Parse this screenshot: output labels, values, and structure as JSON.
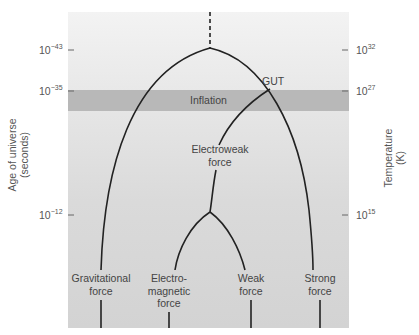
{
  "left_axis": {
    "title_line1": "Age of universe",
    "title_line2": "(seconds)",
    "ticks": [
      {
        "base": "10",
        "exp": "−43"
      },
      {
        "base": "10",
        "exp": "−35"
      },
      {
        "base": "10",
        "exp": "−12"
      }
    ]
  },
  "right_axis": {
    "title_line1": "Temperature",
    "title_line2": "(K)",
    "ticks": [
      {
        "base": "10",
        "exp": "32"
      },
      {
        "base": "10",
        "exp": "27"
      },
      {
        "base": "10",
        "exp": "15"
      }
    ]
  },
  "band": {
    "label": "Inflation",
    "color": "#b8b8b8"
  },
  "nodes": {
    "gut": "GUT",
    "electroweak_line1": "Electroweak",
    "electroweak_line2": "force",
    "gravitational_line1": "Gravitational",
    "gravitational_line2": "force",
    "em_line1": "Electro-",
    "em_line2": "magnetic",
    "em_line3": "force",
    "weak_line1": "Weak",
    "weak_line2": "force",
    "strong_line1": "Strong",
    "strong_line2": "force"
  },
  "colors": {
    "line": "#222222",
    "panel_top": "#f3f3f3",
    "panel_bottom": "#d3d3d3"
  }
}
